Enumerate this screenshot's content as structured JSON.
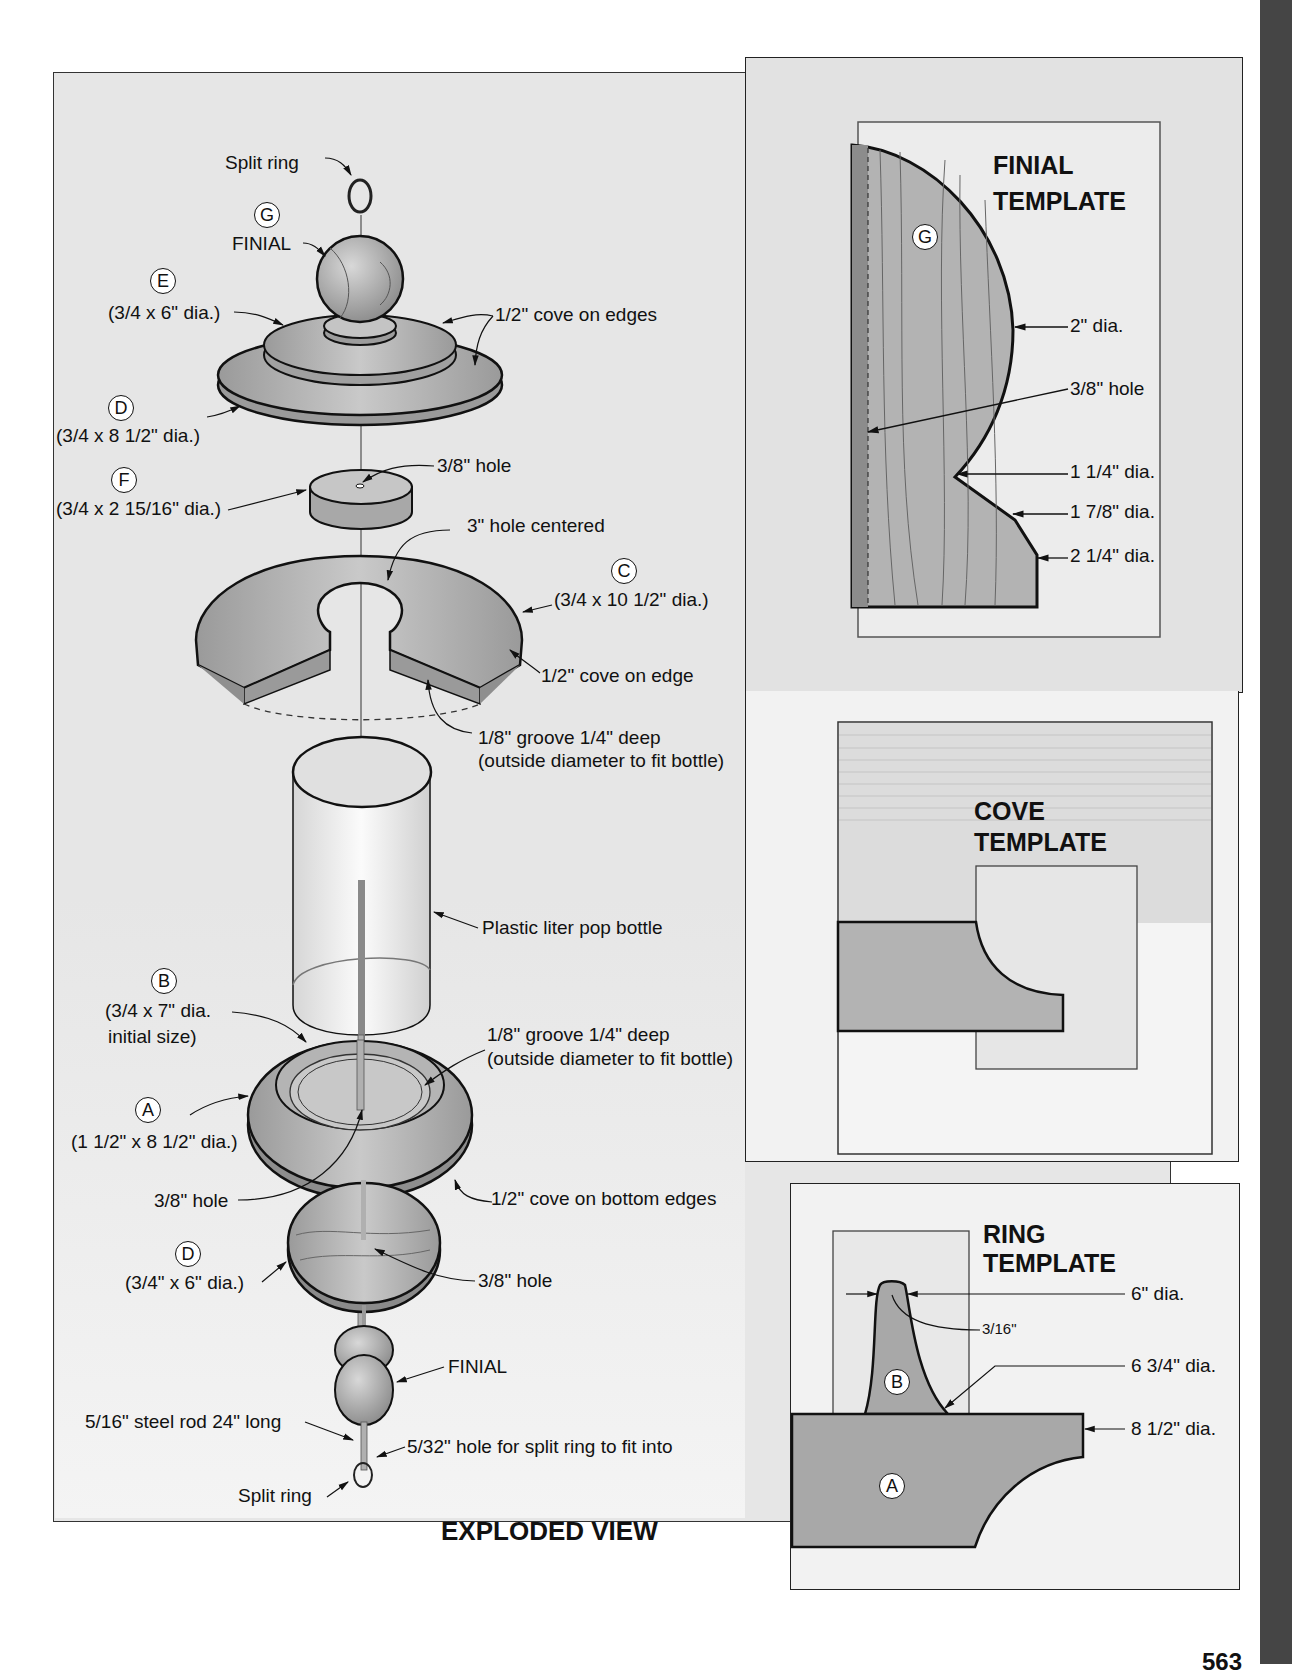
{
  "page": {
    "page_number": "563",
    "side_tab_color": "#444444"
  },
  "exploded_view": {
    "title": "EXPLODED VIEW",
    "labels": {
      "split_ring_top": "Split ring",
      "part_g_letter": "G",
      "finial_top": "FINIAL",
      "part_e_letter": "E",
      "part_e_dims": "(3/4 x 6\" dia.)",
      "cove_on_edges": "1/2\" cove on edges",
      "part_d_top_letter": "D",
      "part_d_top_dims": "(3/4 x 8 1/2\" dia.)",
      "part_f_letter": "F",
      "part_f_dims": "(3/4 x 2 15/16\" dia.)",
      "hole_f": "3/8\" hole",
      "hole_centered": "3\" hole centered",
      "part_c_letter": "C",
      "part_c_dims": "(3/4 x 10 1/2\" dia.)",
      "cove_on_edge": "1/2\" cove on edge",
      "groove_top_line1": "1/8\" groove 1/4\" deep",
      "groove_top_line2": "(outside diameter to fit bottle)",
      "bottle": "Plastic liter pop bottle",
      "part_b_letter": "B",
      "part_b_dims_line1": "(3/4 x 7\" dia.",
      "part_b_dims_line2": "initial size)",
      "groove_bottom_line1": "1/8\" groove 1/4\" deep",
      "groove_bottom_line2": "(outside diameter to fit bottle)",
      "part_a_letter": "A",
      "part_a_dims": "(1 1/2\" x 8 1/2\" dia.)",
      "hole_a": "3/8\" hole",
      "cove_bottom_edges": "1/2\" cove on bottom edges",
      "part_d_bottom_letter": "D",
      "part_d_bottom_dims": "(3/4\" x 6\" dia.)",
      "hole_d_bottom": "3/8\" hole",
      "finial_bottom": "FINIAL",
      "steel_rod": "5/16\" steel rod 24\" long",
      "split_ring_hole": "5/32\" hole for split ring to fit into",
      "split_ring_bottom": "Split ring"
    }
  },
  "finial_template": {
    "title_line1": "FINIAL",
    "title_line2": "TEMPLATE",
    "part_letter": "G",
    "dims": [
      "2\" dia.",
      "3/8\" hole",
      "1 1/4\" dia.",
      "1 7/8\" dia.",
      "2 1/4\" dia."
    ]
  },
  "cove_template": {
    "title_line1": "COVE",
    "title_line2": "TEMPLATE"
  },
  "ring_template": {
    "title_line1": "RING",
    "title_line2": "TEMPLATE",
    "part_b_letter": "B",
    "part_a_letter": "A",
    "dims": [
      "6\" dia.",
      "3/16\"",
      "6 3/4\" dia.",
      "8 1/2\" dia."
    ]
  },
  "colors": {
    "panel_bg": "#e4e4e4",
    "wood": "#b5b5b5",
    "wood_dark": "#8f8f8f",
    "template_paper": "#ececec",
    "line": "#1a1a1a"
  }
}
